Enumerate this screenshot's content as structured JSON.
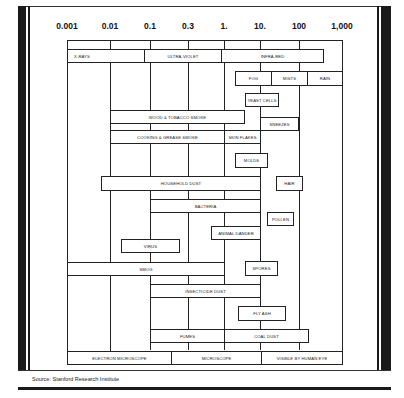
{
  "axis": {
    "ticks": [
      {
        "label": "0.001",
        "value": 0.001
      },
      {
        "label": "0.01",
        "value": 0.01
      },
      {
        "label": "0.1",
        "value": 0.1
      },
      {
        "label": "0.3",
        "value": 0.3
      },
      {
        "label": "1.",
        "value": 1
      },
      {
        "label": "10.",
        "value": 10
      },
      {
        "label": "100",
        "value": 100
      },
      {
        "label": "1,000",
        "value": 1000
      }
    ]
  },
  "bands": {
    "radiation": [
      {
        "label": "X-RAYS",
        "range": [
          0.001,
          0.07
        ]
      },
      {
        "label": "ULTRA-VIOLET",
        "range": [
          0.07,
          0.9
        ]
      },
      {
        "label": "INFRA-RED",
        "range": [
          0.9,
          400
        ]
      }
    ],
    "precipitation": [
      {
        "label": "FOG",
        "range": [
          2,
          30
        ]
      },
      {
        "label": "MISTS",
        "range": [
          30,
          200
        ]
      },
      {
        "label": "RAIN",
        "range": [
          200,
          1000
        ]
      }
    ],
    "detection": [
      {
        "label": "ELECTRON MICROSCOPE",
        "range": [
          0.001,
          0.15
        ]
      },
      {
        "label": "MICROSCOPE",
        "range": [
          0.15,
          10
        ]
      },
      {
        "label": "VISIBLE BY HUMAN EYE",
        "range": [
          10,
          1000
        ]
      }
    ]
  },
  "particles": [
    {
      "label": "YEAST CELLS",
      "range": [
        3,
        30
      ]
    },
    {
      "label": "WOOD & TOBACCO SMOKE",
      "range": [
        0.01,
        4
      ]
    },
    {
      "label": "SNEEZES",
      "range": [
        10,
        100
      ]
    },
    {
      "label": "COOKING & GREASE SMOKE",
      "range": [
        0.01,
        1
      ]
    },
    {
      "label": "SKIN FLAKES",
      "range": [
        1,
        10
      ]
    },
    {
      "label": "MOLDS",
      "range": [
        2,
        20
      ]
    },
    {
      "label": "HOUSEHOLD DUST",
      "range": [
        0.005,
        10
      ]
    },
    {
      "label": "HAIR",
      "range": [
        30,
        150
      ]
    },
    {
      "label": "BACTERIA",
      "range": [
        0.1,
        10
      ]
    },
    {
      "label": "POLLEN",
      "range": [
        20,
        90
      ]
    },
    {
      "label": "ANIMAL DANDER",
      "range": [
        0.5,
        10
      ]
    },
    {
      "label": "VIRUS",
      "range": [
        0.02,
        0.5
      ]
    },
    {
      "label": "SMOG",
      "range": [
        0.001,
        1
      ]
    },
    {
      "label": "SPORES",
      "range": [
        3,
        30
      ]
    },
    {
      "label": "INSECTICIDE DUST",
      "range": [
        0.1,
        10
      ]
    },
    {
      "label": "FLY ASH",
      "range": [
        1.5,
        50
      ]
    },
    {
      "label": "FUMES",
      "range": [
        0.1,
        1
      ]
    },
    {
      "label": "COAL DUST",
      "range": [
        1,
        120
      ]
    }
  ],
  "source": "Source: Stanford Research Institute"
}
